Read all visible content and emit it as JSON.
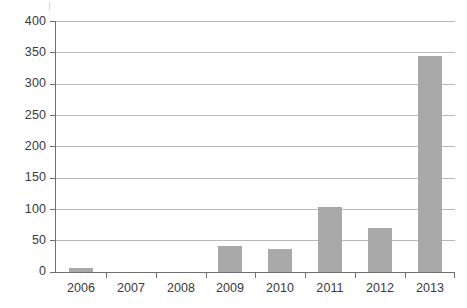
{
  "chart_data": {
    "type": "bar",
    "title": "",
    "subtitle": "",
    "xlabel": "",
    "ylabel": "",
    "categories": [
      "2006",
      "2007",
      "2008",
      "2009",
      "2010",
      "2011",
      "2012",
      "2013"
    ],
    "values": [
      7,
      0,
      0,
      41,
      37,
      104,
      70,
      344
    ],
    "series": [
      {
        "name": "Count",
        "values": [
          7,
          0,
          0,
          41,
          37,
          104,
          70,
          344
        ]
      }
    ],
    "ylim": [
      0,
      400
    ],
    "yticks": [
      0,
      50,
      100,
      150,
      200,
      250,
      300,
      350,
      400
    ],
    "ytick_labels": [
      "0",
      "50",
      "100",
      "150",
      "200",
      "250",
      "300",
      "350",
      "400"
    ],
    "grid": true,
    "grid_axis": "y",
    "legend": false,
    "legend_position": "none",
    "bar_color": "#a9a9a9",
    "grid_color": "#b9b9b9",
    "axis_color": "#6f6f6f",
    "background_color": "#ffffff",
    "annotations": []
  }
}
